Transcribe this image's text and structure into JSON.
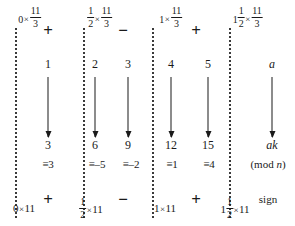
{
  "figure": {
    "modulus_label": "(mod n)",
    "sign_label": "sign",
    "generic_multiplier": "a",
    "generic_result": "ak",
    "times_symbol": "×",
    "equiv_symbol": "≡",
    "plus_symbol": "+",
    "minus_symbol": "−"
  },
  "columns": [
    {
      "id": "col-0",
      "top_coefficient_whole": "0",
      "top_fraction": {
        "numerator": "11",
        "denominator": "3"
      },
      "k": "1",
      "result": "3",
      "congruence": "≡3",
      "bottom_coefficient_whole": "0",
      "bottom_product": "11"
    },
    {
      "id": "col-1",
      "top_coefficient_whole": "",
      "top_coefficient_fraction": {
        "numerator": "1",
        "denominator": "2"
      },
      "top_fraction": {
        "numerator": "11",
        "denominator": "3"
      },
      "k": "2",
      "result": "6",
      "congruence": "≡–5",
      "bottom_coefficient_fraction": {
        "numerator": "1",
        "denominator": "2"
      },
      "bottom_product": "11"
    },
    {
      "id": "col-2",
      "k": "3",
      "result": "9",
      "congruence": "≡–2"
    },
    {
      "id": "col-3",
      "top_coefficient_whole": "1",
      "top_fraction": {
        "numerator": "11",
        "denominator": "3"
      },
      "k": "4",
      "result": "12",
      "congruence": "≡1",
      "bottom_coefficient_whole": "1",
      "bottom_product": "11"
    },
    {
      "id": "col-4",
      "k": "5",
      "result": "15",
      "congruence": "≡4"
    },
    {
      "id": "col-5",
      "top_coefficient_whole": "1",
      "top_coefficient_fraction": {
        "numerator": "1",
        "denominator": "2"
      },
      "top_fraction": {
        "numerator": "11",
        "denominator": "3"
      },
      "k": "a",
      "result": "ak",
      "congruence": "(mod n)",
      "bottom_coefficient_whole": "1",
      "bottom_coefficient_fraction": {
        "numerator": "1",
        "denominator": "2"
      },
      "bottom_product": "11"
    }
  ],
  "operators_top": [
    "+",
    "−",
    "+"
  ],
  "operators_bottom": [
    "+",
    "−",
    "+"
  ],
  "style": {
    "ink": "#1a1a1a",
    "separator": "#3a3a3a",
    "background": "#ffffff"
  }
}
